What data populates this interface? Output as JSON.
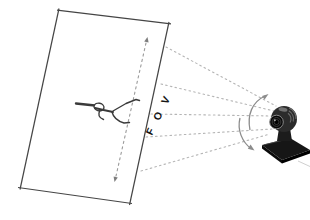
{
  "canvas": {
    "width": 310,
    "height": 220,
    "background": "#ffffff"
  },
  "labels": {
    "fov": "FOV"
  },
  "icons": {
    "camera": "webcam-icon",
    "person": "walking-person-figure",
    "rays": "dashed-fov-rays",
    "span_arrow": "plane-span-double-arrow",
    "tilt_up": "tilt-arrow-up",
    "tilt_down": "tilt-arrow-down"
  },
  "colors": {
    "plane_outline": "#454545",
    "fov_ray_dashed": "#b5b5b5",
    "span_arrow_dashed": "#9a9a9a",
    "rotation_arrow": "#8c8c8c",
    "label_text": "#151515",
    "camera_body": "#1f1f1f",
    "sketch_stroke": "#3a3a3a"
  }
}
